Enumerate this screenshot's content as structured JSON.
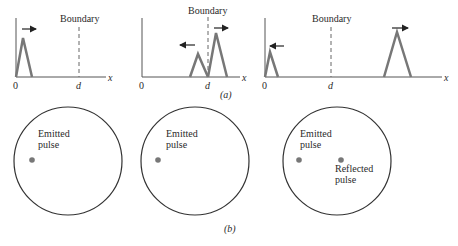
{
  "colors": {
    "axis": "#555555",
    "pulse": "#777777",
    "boundary": "#666666",
    "arrow": "#222222",
    "circle": "#333333",
    "dot": "#777777",
    "text": "#2a2a2a"
  },
  "part_a": {
    "caption": "(a)",
    "axis_x_label": "x",
    "origin_label": "0",
    "boundary_position_label": "d",
    "boundary_label": "Boundary",
    "panels": [
      {
        "id": "a1",
        "description": "Pulse near origin travelling right toward boundary",
        "pulses": [
          {
            "direction": "right",
            "size": "large"
          }
        ]
      },
      {
        "id": "a2",
        "description": "Pulse at boundary: reflected pulse moving left, transmitted pulse moving right",
        "pulses": [
          {
            "direction": "left",
            "size": "small"
          },
          {
            "direction": "right",
            "size": "large"
          }
        ]
      },
      {
        "id": "a3",
        "description": "Reflected small pulse near origin moving left; transmitted large pulse past boundary moving right",
        "pulses": [
          {
            "direction": "left",
            "size": "small"
          },
          {
            "direction": "right",
            "size": "large"
          }
        ]
      }
    ]
  },
  "part_b": {
    "caption": "(b)",
    "panels": [
      {
        "id": "b1",
        "labels": [
          {
            "line1": "Emitted",
            "line2": "pulse"
          }
        ]
      },
      {
        "id": "b2",
        "labels": [
          {
            "line1": "Emitted",
            "line2": "pulse"
          }
        ]
      },
      {
        "id": "b3",
        "labels": [
          {
            "line1": "Emitted",
            "line2": "pulse"
          },
          {
            "line1": "Reflected",
            "line2": "pulse"
          }
        ]
      }
    ]
  }
}
